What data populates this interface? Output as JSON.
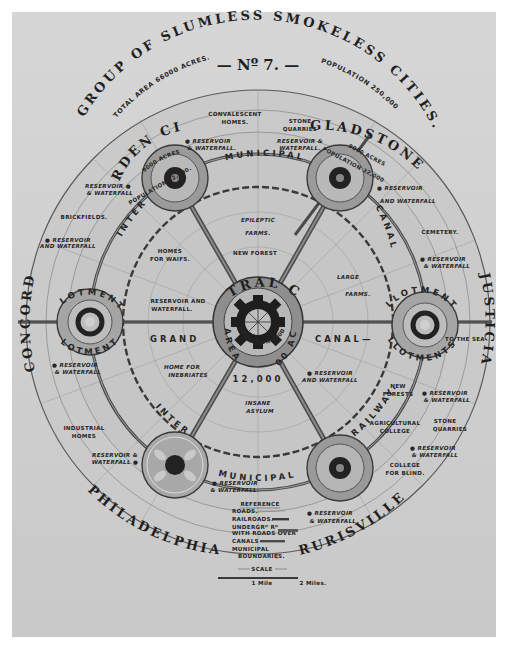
{
  "title": {
    "number": "— Nº 7. —",
    "heading": "GROUP OF SLUMLESS SMOKELESS CITIES.",
    "total_area": "TOTAL AREA 66000 ACRES.",
    "population": "POPULATION 250,000"
  },
  "central_city": {
    "name": "CENTRAL CITY.",
    "area": "AREA",
    "acres": "12000 ACRES",
    "population_label": "POPULATION 58000",
    "population_value": "12,000"
  },
  "cities": [
    {
      "name": "GARDEN CITY.",
      "area": "9000 ACRES",
      "population": "POPULATION 32,000."
    },
    {
      "name": "GLADSTONE",
      "area": "9000 ACRES",
      "population": "POPULATION 32,000"
    },
    {
      "name": "CONCORD"
    },
    {
      "name": "JUSTICIA"
    },
    {
      "name": "PHILADELPHIA"
    },
    {
      "name": "RURISVILLE"
    }
  ],
  "rings": {
    "municipal_top": "MUNICIPAL",
    "municipal_bottom": "MUNICIPAL",
    "inter_top": "INTER",
    "inter_bottom": "INTER",
    "canal": "CANAL",
    "grand": "GRAND",
    "canal_right": "CANAL—",
    "railway": "RAILWAY.",
    "allotments": "ALLOTMENTS."
  },
  "labels": {
    "convalescent_homes": [
      "CONVALESCENT",
      "HOMES."
    ],
    "stone_quarries": [
      "STONE",
      "QUARRIES"
    ],
    "reservoir_waterfall": "RESERVOIR & WATERFALL.",
    "reservoir_and_waterfall": [
      "RESERVOIR",
      "AND WATERFALL"
    ],
    "reservoir_amp": [
      "RESERVOIR",
      "& WATERFALL"
    ],
    "brickfields": "BRICKFIELDS.",
    "homes_for_waifs": [
      "HOMES",
      "FOR WAIFS."
    ],
    "epileptic_farms": [
      "EPILEPTIC",
      "FARMS."
    ],
    "new_forest": "NEW FOREST",
    "large_farms": [
      "LARGE",
      "FARMS."
    ],
    "cemetery": "CEMETERY.",
    "home_for_inebriates": [
      "HOME FOR",
      "INEBRIATES"
    ],
    "insane_asylum": [
      "INSANE",
      "ASYLUM"
    ],
    "new_forests": [
      "NEW",
      "FORESTS"
    ],
    "agricultural_college": [
      "AGRICULTURAL",
      "COLLEGE"
    ],
    "college_for_blind": [
      "COLLEGE",
      "FOR BLIND."
    ],
    "industrial_homes": [
      "INDUSTRIAL",
      "HOMES"
    ],
    "to_the_sea": "TO THE SEA",
    "reservoir_and_waterfall_2": [
      "RESERVOIR AND",
      "WATERFALL."
    ]
  },
  "legend": {
    "title": "REFERENCE",
    "items": [
      "ROADS.",
      "RAILROADS.",
      "UNDERGRᴰ Rᴰ",
      "WITH ROADS OVER",
      "CANALS",
      "MUNICIPAL",
      "BOUNDARIES."
    ],
    "scale_label": "SCALE",
    "scale_1": "1 Mile",
    "scale_2": "2 Miles."
  },
  "colors": {
    "paper": "#d2d2d2",
    "ink": "#262626",
    "ring_dark": "#4a4a4a",
    "ring_mid": "#8a8a8a",
    "ring_light": "#b5b5b5"
  }
}
